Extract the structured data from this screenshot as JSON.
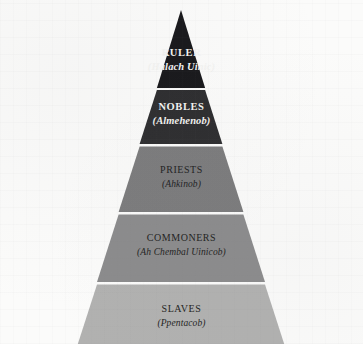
{
  "diagram": {
    "type": "pyramid",
    "name": "maya-social-hierarchy-pyramid",
    "orientation": "apex-top",
    "background_color": "#fbfbfa",
    "divider_color": "#d6d6d2",
    "geometry": {
      "apex_x": 181,
      "apex_y": 10,
      "base_left_x": 15,
      "base_right_x": 348,
      "base_y": 344,
      "divider_y": [
        88,
        144,
        212,
        282
      ]
    },
    "tiers": [
      {
        "rank": 1,
        "title": "RULER",
        "subtitle": "(Halach Uinic)",
        "fill_color": "#17171a",
        "text_color": "#f4f4f2"
      },
      {
        "rank": 2,
        "title": "NOBLES",
        "subtitle": "(Almehenob)",
        "fill_color": "#2c2c2e",
        "text_color": "#f4f4f2"
      },
      {
        "rank": 3,
        "title": "PRIESTS",
        "subtitle": "(Ahkinob)",
        "fill_color": "#7b7b7c",
        "text_color": "#20201f"
      },
      {
        "rank": 4,
        "title": "COMMONERS",
        "subtitle": "(Ah Chembal Uinicob)",
        "fill_color": "#8b8b8c",
        "text_color": "#1e1e1d"
      },
      {
        "rank": 5,
        "title": "SLAVES",
        "subtitle": "(Ppentacob)",
        "fill_color": "#b1b1b0",
        "text_color": "#1e1e1d"
      }
    ]
  }
}
